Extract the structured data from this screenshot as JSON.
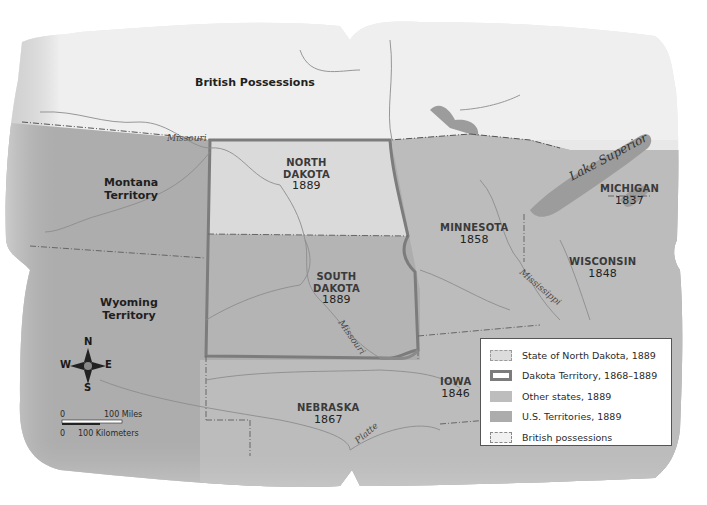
{
  "map": {
    "title_region": "British Possessions",
    "colors": {
      "paper_edge": "#e6e6e6",
      "british_possessions": "#efefef",
      "north_dakota_1889": "#dadada",
      "other_states_1889": "#bdbdbd",
      "us_territories_1889": "#acacac",
      "dakota_territory_border": "#7c7c7c",
      "water": "#9a9a9a",
      "river": "#8c8c8c"
    },
    "regions": [
      {
        "name": "NORTH",
        "name2": "DAKOTA",
        "year": "1889"
      },
      {
        "name": "SOUTH",
        "name2": "DAKOTA",
        "year": "1889"
      },
      {
        "name": "MINNESOTA",
        "year": "1858"
      },
      {
        "name": "MICHIGAN",
        "year": "1837"
      },
      {
        "name": "WISCONSIN",
        "year": "1848"
      },
      {
        "name": "NEBRASKA",
        "year": "1867"
      },
      {
        "name": "IOWA",
        "year": "1846"
      }
    ],
    "territories": [
      {
        "name": "Montana",
        "name2": "Territory"
      },
      {
        "name": "Wyoming",
        "name2": "Territory"
      }
    ],
    "water_labels": {
      "missouri_upper": "Missouri",
      "missouri_lower": "Missouri",
      "mississippi": "Mississippi",
      "platte": "Platte",
      "lake_superior": "Lake Superior"
    }
  },
  "compass": {
    "n": "N",
    "s": "S",
    "e": "E",
    "w": "W"
  },
  "scale": {
    "miles_zero": "0",
    "miles_label": "100 Miles",
    "km_zero": "0",
    "km_label": "100 Kilometers"
  },
  "legend": {
    "items": [
      {
        "label": "State of North Dakota, 1889",
        "swatch": "north-dakota"
      },
      {
        "label": "Dakota Territory, 1868–1889",
        "swatch": "dakota-territory"
      },
      {
        "label": "Other states, 1889",
        "swatch": "other-states"
      },
      {
        "label": "U.S. Territories, 1889",
        "swatch": "us-territories"
      },
      {
        "label": "British possessions",
        "swatch": "british-possessions"
      }
    ]
  }
}
